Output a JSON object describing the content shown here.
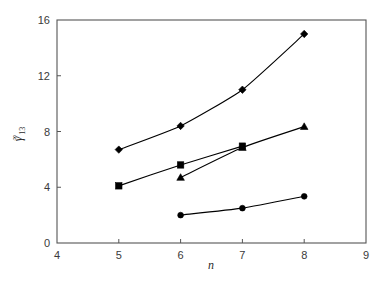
{
  "chart_data": {
    "type": "line",
    "title": "",
    "subtitle": "",
    "xlabel": "n",
    "ylabel": "γ∞13",
    "ylabel_parts": {
      "symbol": "γ",
      "superscript": "∞",
      "subscript": "13"
    },
    "xlim": [
      4,
      9
    ],
    "ylim": [
      0,
      16
    ],
    "xticks": [
      4,
      5,
      6,
      7,
      8,
      9
    ],
    "yticks": [
      0,
      4,
      8,
      12,
      16
    ],
    "xtick_labels": [
      "4",
      "5",
      "6",
      "7",
      "8",
      "9"
    ],
    "ytick_labels": [
      "0",
      "4",
      "8",
      "12",
      "16"
    ],
    "grid": false,
    "legend": "none",
    "frame": "box",
    "line_color": "#000000",
    "marker_color": "#000000",
    "series": [
      {
        "name": "series-diamond",
        "marker": "diamond",
        "x": [
          5,
          6,
          7,
          8
        ],
        "values": [
          6.7,
          8.4,
          11.0,
          15.0
        ]
      },
      {
        "name": "series-square",
        "marker": "square",
        "x": [
          5,
          6,
          7
        ],
        "values": [
          4.1,
          5.6,
          6.95
        ]
      },
      {
        "name": "series-triangle",
        "marker": "triangle",
        "x": [
          6,
          7,
          8
        ],
        "values": [
          4.7,
          6.85,
          8.35
        ]
      },
      {
        "name": "series-circle",
        "marker": "circle",
        "x": [
          6,
          7,
          8
        ],
        "values": [
          2.0,
          2.5,
          3.35
        ]
      }
    ]
  }
}
